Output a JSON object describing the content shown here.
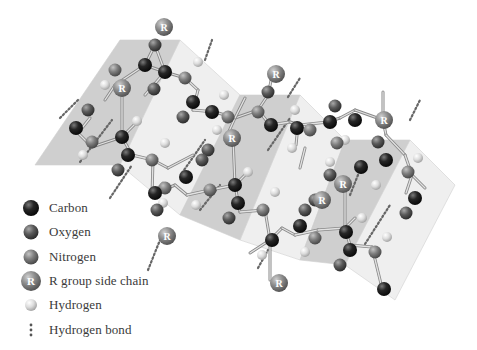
{
  "figure": {
    "colors": {
      "carbon": "#1e1e1e",
      "oxygen": "#5a5a5a",
      "nitrogen": "#7e7e7e",
      "r_group": "#8c8c8c",
      "hydrogen": "#d6d6d6",
      "bond": "#a8a8a8",
      "hbond": "#666666",
      "plane_dark": "#bfbfbf",
      "plane_light": "#e8e8e8",
      "plane_edge": "#d0d0d0"
    }
  },
  "legend": {
    "items": [
      {
        "key": "carbon",
        "label": "Carbon"
      },
      {
        "key": "oxygen",
        "label": "Oxygen"
      },
      {
        "key": "nitrogen",
        "label": "Nitrogen"
      },
      {
        "key": "r_group",
        "label": "R group side chain",
        "glyph": "R"
      },
      {
        "key": "hydrogen",
        "label": "Hydrogen"
      },
      {
        "key": "hbond",
        "label": "Hydrogen bond"
      }
    ]
  },
  "planes": [
    {
      "shade": "dark",
      "points": "120,40 180,40 120,165 35,165"
    },
    {
      "shade": "light",
      "points": "180,40 240,95 180,215 120,165"
    },
    {
      "shade": "dark",
      "points": "240,95 300,95 240,240 180,215"
    },
    {
      "shade": "light",
      "points": "300,95 345,140 300,260 240,240"
    },
    {
      "shade": "dark",
      "points": "345,140 410,140 345,265 300,260"
    },
    {
      "shade": "light",
      "points": "410,140 455,185 395,300 345,265"
    }
  ],
  "bonds": [
    [
      115,
      85,
      145,
      65
    ],
    [
      145,
      65,
      165,
      72
    ],
    [
      165,
      72,
      185,
      78
    ],
    [
      155,
      45,
      165,
      72
    ],
    [
      145,
      65,
      155,
      45
    ],
    [
      185,
      78,
      198,
      90
    ],
    [
      115,
      85,
      105,
      100
    ],
    [
      145,
      95,
      165,
      72
    ],
    [
      198,
      90,
      193,
      110
    ],
    [
      193,
      110,
      215,
      112
    ],
    [
      215,
      112,
      235,
      118
    ],
    [
      235,
      118,
      258,
      110
    ],
    [
      90,
      118,
      78,
      133
    ],
    [
      78,
      133,
      92,
      147
    ],
    [
      92,
      147,
      122,
      137
    ],
    [
      122,
      137,
      132,
      155
    ],
    [
      122,
      137,
      122,
      95
    ],
    [
      122,
      137,
      135,
      124
    ],
    [
      132,
      155,
      153,
      160
    ],
    [
      153,
      160,
      168,
      168
    ],
    [
      153,
      160,
      152,
      195
    ],
    [
      152,
      195,
      163,
      183
    ],
    [
      152,
      195,
      175,
      185
    ],
    [
      175,
      185,
      187,
      195
    ],
    [
      187,
      195,
      210,
      190
    ],
    [
      210,
      190,
      235,
      185
    ],
    [
      235,
      185,
      233,
      138
    ],
    [
      235,
      185,
      248,
      172
    ],
    [
      235,
      185,
      240,
      212
    ],
    [
      240,
      212,
      265,
      210
    ],
    [
      265,
      210,
      270,
      240
    ],
    [
      270,
      240,
      282,
      228
    ],
    [
      270,
      240,
      250,
      253
    ],
    [
      270,
      240,
      270,
      280
    ],
    [
      282,
      228,
      295,
      235
    ],
    [
      295,
      235,
      318,
      230
    ],
    [
      318,
      230,
      345,
      228
    ],
    [
      345,
      228,
      345,
      190
    ],
    [
      345,
      228,
      355,
      218
    ],
    [
      345,
      228,
      350,
      245
    ],
    [
      350,
      245,
      372,
      247
    ],
    [
      372,
      247,
      382,
      288
    ],
    [
      258,
      110,
      268,
      95
    ],
    [
      258,
      110,
      270,
      125
    ],
    [
      268,
      95,
      272,
      76
    ],
    [
      270,
      125,
      290,
      122
    ],
    [
      290,
      122,
      300,
      125
    ],
    [
      300,
      125,
      328,
      122
    ],
    [
      328,
      122,
      340,
      118
    ],
    [
      340,
      118,
      355,
      110
    ],
    [
      355,
      110,
      383,
      120
    ],
    [
      383,
      120,
      383,
      92
    ],
    [
      383,
      120,
      386,
      135
    ],
    [
      386,
      135,
      405,
      155
    ],
    [
      405,
      155,
      412,
      175
    ],
    [
      412,
      175,
      425,
      188
    ],
    [
      412,
      175,
      406,
      193
    ],
    [
      235,
      118,
      225,
      140
    ],
    [
      235,
      118,
      245,
      98
    ],
    [
      298,
      125,
      296,
      145
    ],
    [
      168,
      168,
      193,
      155
    ],
    [
      305,
      148,
      300,
      168
    ]
  ],
  "hbonds": [
    [
      80,
      162,
      112,
      120
    ],
    [
      182,
      173,
      205,
      140
    ],
    [
      268,
      150,
      290,
      118
    ],
    [
      350,
      195,
      358,
      175
    ],
    [
      365,
      244,
      390,
      205
    ],
    [
      205,
      60,
      212,
      40
    ],
    [
      288,
      97,
      300,
      78
    ],
    [
      410,
      120,
      420,
      100
    ],
    [
      148,
      270,
      160,
      240
    ],
    [
      258,
      268,
      268,
      250
    ],
    [
      60,
      118,
      78,
      100
    ],
    [
      110,
      198,
      132,
      165
    ],
    [
      200,
      210,
      220,
      185
    ]
  ],
  "atoms": [
    {
      "type": "carbon",
      "x": 145,
      "y": 65
    },
    {
      "type": "oxygen",
      "x": 155,
      "y": 45
    },
    {
      "type": "carbon",
      "x": 165,
      "y": 72
    },
    {
      "type": "nitrogen",
      "x": 185,
      "y": 78
    },
    {
      "type": "hydrogen",
      "x": 198,
      "y": 62
    },
    {
      "type": "nitrogen",
      "x": 115,
      "y": 70
    },
    {
      "type": "hydrogen",
      "x": 105,
      "y": 85
    },
    {
      "type": "r_group",
      "x": 164,
      "y": 27
    },
    {
      "type": "r_group",
      "x": 122,
      "y": 88
    },
    {
      "type": "oxygen",
      "x": 154,
      "y": 89
    },
    {
      "type": "carbon",
      "x": 193,
      "y": 102
    },
    {
      "type": "carbon",
      "x": 212,
      "y": 112
    },
    {
      "type": "oxygen",
      "x": 183,
      "y": 117
    },
    {
      "type": "nitrogen",
      "x": 228,
      "y": 117
    },
    {
      "type": "hydrogen",
      "x": 224,
      "y": 95
    },
    {
      "type": "hydrogen",
      "x": 217,
      "y": 130
    },
    {
      "type": "r_group",
      "x": 232,
      "y": 138
    },
    {
      "type": "oxygen",
      "x": 88,
      "y": 110
    },
    {
      "type": "carbon",
      "x": 76,
      "y": 128
    },
    {
      "type": "nitrogen",
      "x": 92,
      "y": 142
    },
    {
      "type": "hydrogen",
      "x": 83,
      "y": 155
    },
    {
      "type": "carbon",
      "x": 122,
      "y": 137
    },
    {
      "type": "hydrogen",
      "x": 137,
      "y": 121
    },
    {
      "type": "carbon",
      "x": 128,
      "y": 155
    },
    {
      "type": "oxygen",
      "x": 118,
      "y": 170
    },
    {
      "type": "nitrogen",
      "x": 152,
      "y": 160
    },
    {
      "type": "hydrogen",
      "x": 165,
      "y": 143
    },
    {
      "type": "oxygen",
      "x": 208,
      "y": 150
    },
    {
      "type": "oxygen",
      "x": 202,
      "y": 160
    },
    {
      "type": "carbon",
      "x": 186,
      "y": 177
    },
    {
      "type": "nitrogen",
      "x": 165,
      "y": 188
    },
    {
      "type": "hydrogen",
      "x": 163,
      "y": 203
    },
    {
      "type": "carbon",
      "x": 155,
      "y": 193
    },
    {
      "type": "oxygen",
      "x": 157,
      "y": 210
    },
    {
      "type": "nitrogen",
      "x": 210,
      "y": 190
    },
    {
      "type": "hydrogen",
      "x": 196,
      "y": 205
    },
    {
      "type": "carbon",
      "x": 235,
      "y": 185
    },
    {
      "type": "hydrogen",
      "x": 248,
      "y": 172
    },
    {
      "type": "carbon",
      "x": 238,
      "y": 203
    },
    {
      "type": "oxygen",
      "x": 229,
      "y": 218
    },
    {
      "type": "nitrogen",
      "x": 263,
      "y": 210
    },
    {
      "type": "hydrogen",
      "x": 275,
      "y": 192
    },
    {
      "type": "r_group",
      "x": 167,
      "y": 236
    },
    {
      "type": "carbon",
      "x": 272,
      "y": 240
    },
    {
      "type": "hydrogen",
      "x": 262,
      "y": 255
    },
    {
      "type": "r_group",
      "x": 279,
      "y": 283
    },
    {
      "type": "oxygen",
      "x": 305,
      "y": 210
    },
    {
      "type": "oxygen",
      "x": 315,
      "y": 200
    },
    {
      "type": "carbon",
      "x": 300,
      "y": 226
    },
    {
      "type": "nitrogen",
      "x": 315,
      "y": 238
    },
    {
      "type": "hydrogen",
      "x": 305,
      "y": 252
    },
    {
      "type": "carbon",
      "x": 346,
      "y": 232
    },
    {
      "type": "hydrogen",
      "x": 362,
      "y": 218
    },
    {
      "type": "carbon",
      "x": 350,
      "y": 250
    },
    {
      "type": "oxygen",
      "x": 340,
      "y": 265
    },
    {
      "type": "nitrogen",
      "x": 375,
      "y": 252
    },
    {
      "type": "hydrogen",
      "x": 387,
      "y": 237
    },
    {
      "type": "carbon",
      "x": 384,
      "y": 289
    },
    {
      "type": "r_group",
      "x": 343,
      "y": 184
    },
    {
      "type": "carbon",
      "x": 271,
      "y": 125
    },
    {
      "type": "nitrogen",
      "x": 258,
      "y": 112
    },
    {
      "type": "oxygen",
      "x": 268,
      "y": 92
    },
    {
      "type": "r_group",
      "x": 276,
      "y": 74
    },
    {
      "type": "carbon",
      "x": 297,
      "y": 128
    },
    {
      "type": "hydrogen",
      "x": 295,
      "y": 110
    },
    {
      "type": "nitrogen",
      "x": 310,
      "y": 130
    },
    {
      "type": "hydrogen",
      "x": 292,
      "y": 148
    },
    {
      "type": "carbon",
      "x": 330,
      "y": 122
    },
    {
      "type": "oxygen",
      "x": 335,
      "y": 106
    },
    {
      "type": "carbon",
      "x": 355,
      "y": 120
    },
    {
      "type": "hydrogen",
      "x": 345,
      "y": 140
    },
    {
      "type": "r_group",
      "x": 384,
      "y": 120
    },
    {
      "type": "oxygen",
      "x": 378,
      "y": 142
    },
    {
      "type": "carbon",
      "x": 386,
      "y": 160
    },
    {
      "type": "hydrogen",
      "x": 376,
      "y": 185
    },
    {
      "type": "nitrogen",
      "x": 408,
      "y": 172
    },
    {
      "type": "hydrogen",
      "x": 418,
      "y": 158
    },
    {
      "type": "carbon",
      "x": 415,
      "y": 198
    },
    {
      "type": "oxygen",
      "x": 406,
      "y": 213
    },
    {
      "type": "r_group",
      "x": 322,
      "y": 200
    },
    {
      "type": "oxygen",
      "x": 330,
      "y": 175
    },
    {
      "type": "nitrogen",
      "x": 337,
      "y": 143
    },
    {
      "type": "carbon",
      "x": 361,
      "y": 167
    },
    {
      "type": "hydrogen",
      "x": 330,
      "y": 162
    }
  ]
}
